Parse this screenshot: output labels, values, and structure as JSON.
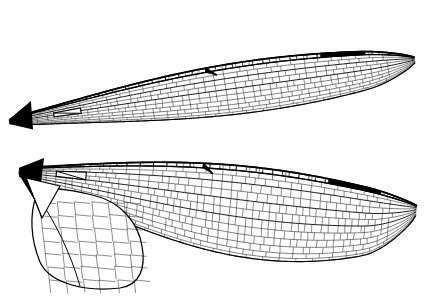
{
  "figure": {
    "style": "scientific line illustration",
    "background_color": "#ffffff",
    "ink_color": "#000000",
    "vein_color": "#1a1a1a",
    "width": 425,
    "height": 297,
    "caption": ""
  },
  "chart_data": {
    "type": "diagram",
    "specimens": [
      {
        "name": "forewing",
        "label": "Forewing",
        "orientation": "base at lower-left, apex at upper-right, tilted approx -18 degrees",
        "base_xy": [
          8,
          118
        ],
        "apex_xy": [
          421,
          52
        ],
        "chord_max": 62,
        "outline_path": "M8,118 C10,100 24,90 60,78 C110,60 190,38 262,22 C320,10 372,8 398,18 C418,27 422,44 414,62 C402,84 368,103 318,118 C258,135 170,143 104,143 C56,143 18,136 8,118 Z",
        "features": {
          "pterostigma": {
            "name": "pterostigma",
            "visible": true,
            "color": "#000000",
            "bbox": [
              324,
              7,
              44,
              11
            ]
          },
          "nodus": {
            "name": "nodus",
            "visible": true,
            "xy": [
              210,
              47
            ]
          },
          "discoidal_triangle": {
            "name": "discoidal-triangle",
            "visible": true,
            "xy": [
              84,
              122
            ]
          },
          "wing_base_sclerite": {
            "name": "wing-base",
            "visible": true,
            "color": "#000000",
            "xy": [
              12,
              120
            ]
          },
          "antenodal_crossveins": 14,
          "postnodal_crossveins": 22,
          "cell_count_estimate": 640
        }
      },
      {
        "name": "hindwing",
        "label": "Hindwing",
        "orientation": "base at left, apex at right, tilted approx -10 degrees",
        "base_xy": [
          18,
          168
        ],
        "apex_xy": [
          420,
          212
        ],
        "chord_max": 108,
        "outline_path": "M18,168 C20,160 30,156 58,154 C120,150 220,152 300,156 C356,160 396,172 414,192 C424,206 418,226 396,242 C366,262 310,278 240,286 C160,294 88,292 50,282 C30,276 22,262 24,240 C26,212 20,186 18,168 Z",
        "features": {
          "pterostigma": {
            "name": "pterostigma",
            "visible": true,
            "color": "#000000",
            "bbox": [
              330,
              146,
              54,
              12
            ]
          },
          "nodus": {
            "name": "nodus",
            "visible": true,
            "xy": [
              200,
              167
            ]
          },
          "discoidal_triangle": {
            "name": "discoidal-triangle",
            "visible": true,
            "xy": [
              78,
              200
            ]
          },
          "anal_loop": {
            "name": "anal-loop",
            "visible": true,
            "xy": [
              62,
              245
            ]
          },
          "anal_triangle": {
            "name": "anal-triangle",
            "visible": true,
            "xy": [
              40,
              215
            ]
          },
          "wing_base_sclerite": {
            "name": "wing-base",
            "visible": true,
            "color": "#000000",
            "xy": [
              22,
              172
            ]
          },
          "antenodal_crossveins": 14,
          "postnodal_crossveins": 24,
          "cell_count_estimate": 900
        }
      }
    ],
    "legend": [],
    "annotations": [],
    "xlabel": "",
    "ylabel": ""
  }
}
